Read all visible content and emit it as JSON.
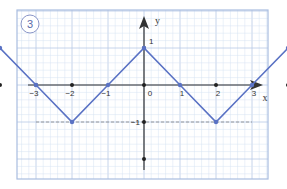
{
  "figure": {
    "badge_number": "3",
    "colors": {
      "grid_minor": "#d6e2f2",
      "grid_major": "#b7c9e6",
      "frame": "#a9bde0",
      "curve": "#5a72c4",
      "axis": "#333333",
      "dashed": "#888888"
    }
  },
  "chart_data": {
    "type": "line",
    "title": "",
    "xlabel": "x",
    "ylabel": "y",
    "xlim": [
      -4,
      4
    ],
    "ylim": [
      -2,
      2
    ],
    "grid": true,
    "x_tick_labels": [
      "-3",
      "-2",
      "-1",
      "0",
      "1",
      "2",
      "3"
    ],
    "y_tick_labels": [
      "1",
      "-1"
    ],
    "axis_dots_x": [
      -4,
      -3,
      -2,
      0,
      2,
      4
    ],
    "axis_dots_y": [
      1,
      -1,
      -2
    ],
    "series": [
      {
        "name": "y = ||x| - 2| - 1",
        "points": [
          [
            -4.2,
            1.2
          ],
          [
            -4,
            1
          ],
          [
            -3,
            0
          ],
          [
            -2,
            -1
          ],
          [
            -1,
            0
          ],
          [
            0,
            1
          ],
          [
            1,
            0
          ],
          [
            2,
            -1
          ],
          [
            3,
            0
          ],
          [
            4,
            1
          ],
          [
            4.2,
            1.2
          ]
        ],
        "marked_points": [
          [
            -4,
            1
          ],
          [
            -3,
            0
          ],
          [
            -2,
            -1
          ],
          [
            -1,
            0
          ],
          [
            0,
            1
          ],
          [
            1,
            0
          ],
          [
            2,
            -1
          ],
          [
            3,
            0
          ],
          [
            4,
            1
          ]
        ]
      }
    ],
    "annotations": [
      {
        "type": "dashed_hline",
        "y": -1,
        "from_x": -3,
        "to_x": 3
      }
    ]
  }
}
